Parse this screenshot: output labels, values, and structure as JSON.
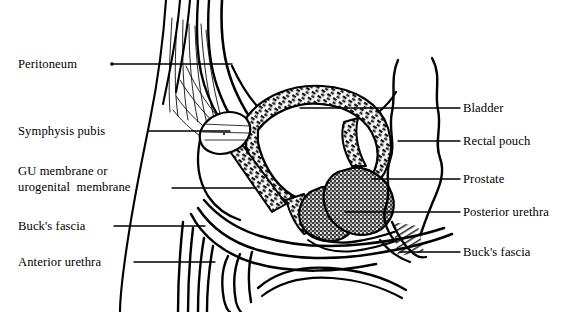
{
  "figure": {
    "style": "black-and-white line drawing",
    "background": "#ffffff",
    "ink": "#000000"
  },
  "labels": {
    "left": [
      {
        "id": "peritoneum",
        "text": "Peritoneum",
        "x": 18,
        "y": 57,
        "leader": {
          "x1": 112,
          "y1": 64,
          "x2": 232,
          "y2": 64,
          "dot": "left"
        }
      },
      {
        "id": "symphysis",
        "text": "Symphysis pubis",
        "x": 18,
        "y": 124,
        "leader": {
          "x1": 148,
          "y1": 131,
          "x2": 230,
          "y2": 131,
          "dot": "none"
        }
      },
      {
        "id": "gu-membrane",
        "line1": "GU membrane or",
        "line2": "urogenital  membrane",
        "x": 18,
        "y": 164,
        "leader": {
          "x1": 172,
          "y1": 188,
          "x2": 256,
          "y2": 188,
          "dot": "none"
        }
      },
      {
        "id": "bucks-fascia-left",
        "text": "Buck's fascia",
        "x": 18,
        "y": 219,
        "leader": {
          "x1": 114,
          "y1": 226,
          "x2": 205,
          "y2": 226,
          "dot": "none"
        }
      },
      {
        "id": "anterior-urethra",
        "text": "Anterior urethra",
        "x": 18,
        "y": 255,
        "leader": {
          "x1": 134,
          "y1": 262,
          "x2": 215,
          "y2": 262,
          "dot": "none"
        }
      }
    ],
    "right": [
      {
        "id": "bladder",
        "text": "Bladder",
        "x": 463,
        "y": 101,
        "leader": {
          "x1": 300,
          "y1": 108,
          "x2": 460,
          "y2": 108,
          "dot": "none"
        }
      },
      {
        "id": "rectal-pouch",
        "text": "Rectal pouch",
        "x": 463,
        "y": 134,
        "leader": {
          "x1": 398,
          "y1": 141,
          "x2": 460,
          "y2": 141,
          "dot": "none"
        }
      },
      {
        "id": "prostate",
        "text": "Prostate",
        "x": 463,
        "y": 172,
        "leader": {
          "x1": 372,
          "y1": 179,
          "x2": 460,
          "y2": 179,
          "dot": "none"
        }
      },
      {
        "id": "posterior-urethra",
        "text": "Posterior urethra",
        "x": 463,
        "y": 205,
        "leader": {
          "x1": 345,
          "y1": 212,
          "x2": 460,
          "y2": 212,
          "dot": "none"
        }
      },
      {
        "id": "bucks-fascia-right",
        "text": "Buck's fascia",
        "x": 463,
        "y": 245,
        "leader": {
          "x1": 400,
          "y1": 252,
          "x2": 460,
          "y2": 252,
          "dot": "none"
        }
      }
    ]
  },
  "structures": [
    {
      "id": "bladder-lumen",
      "name": "Bladder",
      "fill": "#ffffff",
      "wall": "hatched"
    },
    {
      "id": "bladder-wall",
      "name": "Bladder wall",
      "fill": "#1a1a1a",
      "pattern": "dense-hatch"
    },
    {
      "id": "peritoneum-line",
      "name": "Peritoneum",
      "stroke": "#000000"
    },
    {
      "id": "symphysis-pubis",
      "name": "Symphysis pubis",
      "fill": "#ffffff",
      "pattern": "radiating-striations"
    },
    {
      "id": "prostate-gland",
      "name": "Prostate",
      "fill": "#2b2b2b",
      "pattern": "stipple"
    },
    {
      "id": "rectum",
      "name": "Rectal pouch",
      "stroke": "#000000"
    },
    {
      "id": "penile-shaft",
      "name": "Anterior urethra / Buck's fascia",
      "stroke": "#000000"
    },
    {
      "id": "anal-sphincter",
      "name": "Anal region",
      "pattern": "fine-hatch"
    }
  ]
}
